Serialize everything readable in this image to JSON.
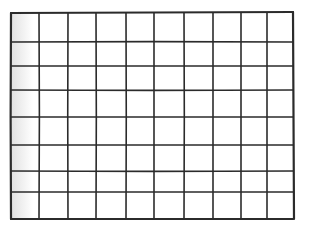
{
  "figure": {
    "columns": 10,
    "rows": 8,
    "line_color": "#2b2b2b",
    "background": "#ffffff",
    "vertical_lines_x": [
      11,
      39,
      68,
      96,
      126,
      154,
      184,
      213,
      241,
      267,
      293
    ],
    "horizontal_lines_y": [
      13,
      42,
      66,
      90,
      117,
      145,
      171,
      192,
      219
    ]
  }
}
